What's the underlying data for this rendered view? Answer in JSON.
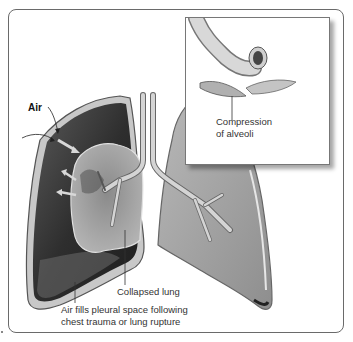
{
  "figure": {
    "labels": {
      "air": "Air",
      "collapsed_lung": "Collapsed lung",
      "pleural_line1": "Air fills pleural space following",
      "pleural_line2": "chest trauma or lung rupture",
      "inset_line1": "Compression",
      "inset_line2": "of alveoli"
    },
    "colors": {
      "frame": "#6a6a6a",
      "lung_fill": "#a9a9a9",
      "pleural_dark": "#3c3c3c",
      "airway": "#cfcfcf",
      "text": "#333333"
    }
  }
}
